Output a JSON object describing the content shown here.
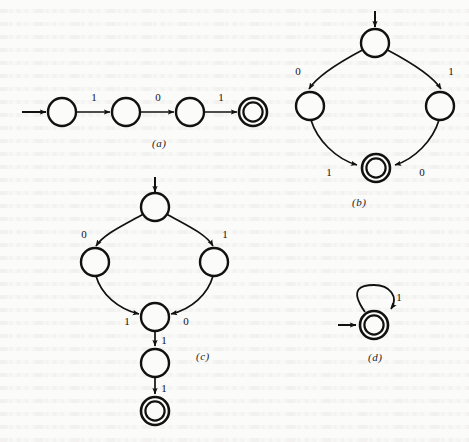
{
  "figure": {
    "kind": "finite-state-automata-diagrams",
    "background_color": "#fbfbfa",
    "ink_color": "#111111",
    "panels": [
      {
        "id": "a",
        "caption": "(a)",
        "caption_x": 152,
        "caption_y": 142,
        "description": "Linear four-state automaton accepting the string 101",
        "start_arrow": {
          "x1": 22,
          "y1": 112,
          "x2": 48,
          "y2": 112
        },
        "states": [
          {
            "name": "q0",
            "cx": 62,
            "cy": 112,
            "r": 14,
            "accepting": false,
            "start": true
          },
          {
            "name": "q1",
            "cx": 126,
            "cy": 112,
            "r": 14,
            "accepting": false,
            "start": false
          },
          {
            "name": "q2",
            "cx": 190,
            "cy": 112,
            "r": 14,
            "accepting": false,
            "start": false
          },
          {
            "name": "q3",
            "cx": 253,
            "cy": 112,
            "r": 14,
            "accepting": true,
            "start": false
          }
        ],
        "transitions": [
          {
            "from": "q0",
            "to": "q1",
            "label": "1",
            "label_x": 94,
            "label_y": 101
          },
          {
            "from": "q1",
            "to": "q2",
            "label": "0",
            "label_x": 158,
            "label_y": 101
          },
          {
            "from": "q2",
            "to": "q3",
            "label": "1",
            "label_x": 221,
            "label_y": 101
          }
        ]
      },
      {
        "id": "b",
        "caption": "(b)",
        "caption_x": 352,
        "caption_y": 203,
        "description": "Diamond/cycle automaton: top start state branches on 0 and 1 to two states, both converge on the accepting state",
        "start_arrow": {
          "x1": 375,
          "y1": 12,
          "x2": 375,
          "y2": 29
        },
        "states": [
          {
            "name": "s0",
            "cx": 375,
            "cy": 43,
            "r": 14,
            "accepting": false,
            "start": true
          },
          {
            "name": "sL",
            "cx": 310,
            "cy": 106,
            "r": 14,
            "accepting": false,
            "start": false
          },
          {
            "name": "sR",
            "cx": 440,
            "cy": 106,
            "r": 14,
            "accepting": false,
            "start": false
          },
          {
            "name": "sF",
            "cx": 376,
            "cy": 168,
            "r": 14,
            "accepting": true,
            "start": false
          }
        ],
        "transitions": [
          {
            "from": "s0",
            "to": "sL",
            "label": "0",
            "label_x": 298,
            "label_y": 72
          },
          {
            "from": "s0",
            "to": "sR",
            "label": "1",
            "label_x": 449,
            "label_y": 72
          },
          {
            "from": "sL",
            "to": "sF",
            "label": "1",
            "label_x": 328,
            "label_y": 172
          },
          {
            "from": "sR",
            "to": "sF",
            "label": "0",
            "label_x": 420,
            "label_y": 172
          }
        ]
      },
      {
        "id": "c",
        "caption": "(c)",
        "caption_x": 196,
        "caption_y": 357,
        "description": "Diamond automaton with a two-state tail reading 1 then 1 to the accepting state",
        "start_arrow": {
          "x1": 155,
          "y1": 178,
          "x2": 155,
          "y2": 194
        },
        "states": [
          {
            "name": "t0",
            "cx": 155,
            "cy": 207,
            "r": 14,
            "accepting": false,
            "start": true
          },
          {
            "name": "tL",
            "cx": 95,
            "cy": 262,
            "r": 14,
            "accepting": false,
            "start": false
          },
          {
            "name": "tR",
            "cx": 214,
            "cy": 262,
            "r": 14,
            "accepting": false,
            "start": false
          },
          {
            "name": "tM",
            "cx": 155,
            "cy": 317,
            "r": 14,
            "accepting": false,
            "start": false
          },
          {
            "name": "tN",
            "cx": 155,
            "cy": 363,
            "r": 14,
            "accepting": false,
            "start": false
          },
          {
            "name": "tF",
            "cx": 155,
            "cy": 411,
            "r": 14,
            "accepting": true,
            "start": false
          }
        ],
        "transitions": [
          {
            "from": "t0",
            "to": "tL",
            "label": "0",
            "label_x": 84,
            "label_y": 235
          },
          {
            "from": "t0",
            "to": "tR",
            "label": "1",
            "label_x": 223,
            "label_y": 235
          },
          {
            "from": "tL",
            "to": "tM",
            "label": "1",
            "label_x": 127,
            "label_y": 322
          },
          {
            "from": "tR",
            "to": "tM",
            "label": "0",
            "label_x": 186,
            "label_y": 322
          },
          {
            "from": "tM",
            "to": "tN",
            "label": "1",
            "label_x": 162,
            "label_y": 342
          },
          {
            "from": "tN",
            "to": "tF",
            "label": "1",
            "label_x": 162,
            "label_y": 390
          }
        ]
      },
      {
        "id": "d",
        "caption": "(d)",
        "caption_x": 368,
        "caption_y": 358,
        "description": "Single accepting start state with a self-loop on 1",
        "start_arrow": {
          "x1": 339,
          "y1": 325,
          "x2": 357,
          "y2": 325
        },
        "states": [
          {
            "name": "u0",
            "cx": 374,
            "cy": 325,
            "r": 14,
            "accepting": true,
            "start": true
          }
        ],
        "transitions": [
          {
            "from": "u0",
            "to": "u0",
            "label": "1",
            "label_x": 397,
            "label_y": 299,
            "self_loop": true
          }
        ]
      }
    ]
  }
}
